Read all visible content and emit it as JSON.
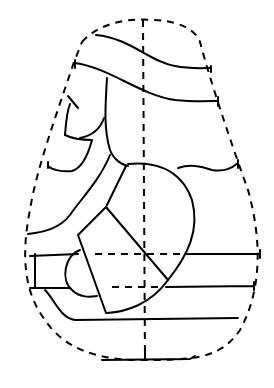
{
  "diagram": {
    "type": "line-drawing",
    "background": "#ffffff",
    "stroke_color": "#000000",
    "elements": {
      "outline": "dashed pear-shaped outer contour",
      "axis": "dashed vertical center axis",
      "section_lines": "dashed horizontal section lines",
      "contours": "solid internal contour lines",
      "base_line": "solid horizontal base line"
    }
  }
}
